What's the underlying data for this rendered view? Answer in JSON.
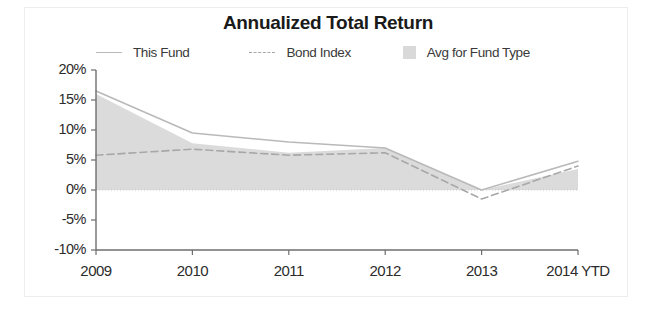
{
  "card": {
    "title": "Annualized Total Return"
  },
  "legend": {
    "position": "top",
    "items": [
      {
        "label": "This Fund",
        "marker": "solid-line",
        "color": "#b9b9b9"
      },
      {
        "label": "Bond Index",
        "marker": "dashed-line",
        "color": "#a8a8a8"
      },
      {
        "label": "Avg for Fund Type",
        "marker": "filled-square",
        "color": "#d9d9d9"
      }
    ]
  },
  "axes": {
    "y_ticks": [
      "20%",
      "15%",
      "10%",
      "5%",
      "0%",
      "-5%",
      "-10%"
    ],
    "x_ticks": [
      "2009",
      "2010",
      "2011",
      "2012",
      "2013",
      "2014 YTD"
    ]
  },
  "colors": {
    "this_fund": "#b9b9b9",
    "bond_index": "#a8a8a8",
    "avg_fund_type_fill": "#d5d5d5",
    "axis": "#6e6e6e",
    "zero_line": "#c9c9c9",
    "frame": "#ededed",
    "text": "#2b2b2b"
  },
  "chart_data": {
    "type": "line",
    "title": "Annualized Total Return",
    "xlabel": "",
    "ylabel": "",
    "categories": [
      "2009",
      "2010",
      "2011",
      "2012",
      "2013",
      "2014 YTD"
    ],
    "ylim": [
      -10,
      20
    ],
    "y_tick_values": [
      20,
      15,
      10,
      5,
      0,
      -5,
      -10
    ],
    "y_tick_labels": [
      "20%",
      "15%",
      "10%",
      "5%",
      "0%",
      "-5%",
      "-10%"
    ],
    "grid": false,
    "zero_line": true,
    "legend_position": "top",
    "series": [
      {
        "name": "This Fund",
        "style": "solid",
        "color": "#b9b9b9",
        "values": [
          16.5,
          9.5,
          8.0,
          7.0,
          0.0,
          4.8
        ]
      },
      {
        "name": "Bond Index",
        "style": "dashed",
        "color": "#a8a8a8",
        "values": [
          5.8,
          6.8,
          5.8,
          6.2,
          -1.5,
          4.0
        ]
      },
      {
        "name": "Avg for Fund Type",
        "style": "area",
        "color": "#d5d5d5",
        "values": [
          16.0,
          7.8,
          6.2,
          7.0,
          0.0,
          3.5
        ]
      }
    ]
  }
}
